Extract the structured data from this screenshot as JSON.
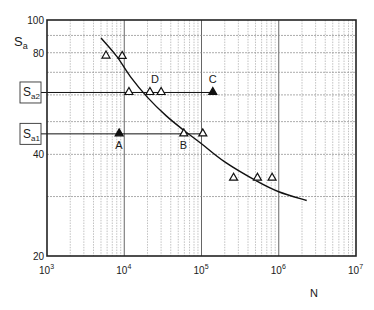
{
  "chart_data": {
    "type": "scatter",
    "title": "",
    "xlabel": "N",
    "ylabel": "S_a",
    "xscale": "log",
    "yscale": "log",
    "xlim": [
      1000,
      10000000
    ],
    "ylim": [
      20,
      100
    ],
    "x_ticks": [
      {
        "value": 1000,
        "base": "10",
        "exp": "3"
      },
      {
        "value": 10000,
        "base": "10",
        "exp": "4"
      },
      {
        "value": 100000,
        "base": "10",
        "exp": "5"
      },
      {
        "value": 1000000,
        "base": "10",
        "exp": "6"
      },
      {
        "value": 10000000,
        "base": "10",
        "exp": "7"
      }
    ],
    "y_ticks": [
      {
        "value": 100,
        "label": "100"
      },
      {
        "value": 80,
        "label": "80"
      },
      {
        "value": 40,
        "label": "40"
      },
      {
        "value": 20,
        "label": "20"
      }
    ],
    "y_grid": [
      90,
      80,
      70,
      60,
      50,
      40,
      30
    ],
    "grid": true,
    "reference_levels": [
      {
        "name": "S_a2",
        "label_main": "S",
        "label_sub": "a2",
        "value": 61,
        "x_end": 140000
      },
      {
        "name": "S_a1",
        "label_main": "S",
        "label_sub": "a1",
        "value": 46,
        "x_end": 104000
      }
    ],
    "curve": {
      "name": "S-N curve",
      "points": [
        [
          5000,
          88.4
        ],
        [
          8000,
          78
        ],
        [
          12000,
          68
        ],
        [
          20000,
          59
        ],
        [
          35000,
          52
        ],
        [
          60000,
          47
        ],
        [
          100000,
          43
        ],
        [
          200000,
          38
        ],
        [
          500000,
          33.5
        ],
        [
          1000000,
          31
        ],
        [
          2300000,
          29.2
        ]
      ]
    },
    "series": [
      {
        "name": "test results",
        "marker": "open-triangle",
        "points": [
          [
            5800,
            78.2
          ],
          [
            9400,
            78
          ],
          [
            11500,
            61
          ],
          [
            21500,
            61
          ],
          [
            30000,
            61
          ],
          [
            59000,
            46
          ],
          [
            104000,
            46
          ],
          [
            260000,
            34
          ],
          [
            530000,
            34
          ],
          [
            820000,
            34
          ]
        ]
      },
      {
        "name": "reference points",
        "marker": "filled-triangle",
        "points": [
          [
            8600,
            46
          ],
          [
            140000,
            61
          ]
        ]
      }
    ],
    "annotations": [
      {
        "text": "A",
        "x": 8600,
        "y": 46,
        "pos": "below"
      },
      {
        "text": "B",
        "x": 59000,
        "y": 46,
        "pos": "below"
      },
      {
        "text": "C",
        "x": 140000,
        "y": 61,
        "pos": "above"
      },
      {
        "text": "D",
        "x": 30000,
        "y": 61,
        "pos": "above-left"
      }
    ]
  }
}
